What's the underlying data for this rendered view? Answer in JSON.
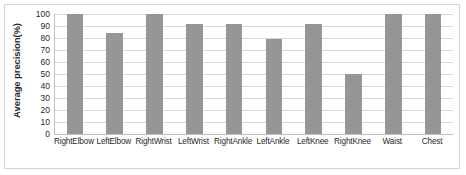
{
  "chart_data": {
    "type": "bar",
    "title": "",
    "xlabel": "",
    "ylabel": "Average precision(%)",
    "ylim": [
      0,
      100
    ],
    "ytick_step": 10,
    "grid": true,
    "legend": "none",
    "bar_color": "#969696",
    "gridline_color": "#d9d9d9",
    "axis_color": "#bfbfbf",
    "border_color": "#d4d4d4",
    "ytick_labels": [
      "100",
      "90",
      "80",
      "70",
      "60",
      "50",
      "40",
      "30",
      "20",
      "10",
      "0"
    ],
    "categories": [
      "RightElbow",
      "LeftElbow",
      "RightWrist",
      "LeftWrist",
      "RightAnkle",
      "LeftAnkle",
      "LeftKnee",
      "RightKnee",
      "Waist",
      "Chest"
    ],
    "values": [
      100,
      84,
      100,
      92,
      92,
      79,
      92,
      50,
      100,
      100
    ]
  }
}
